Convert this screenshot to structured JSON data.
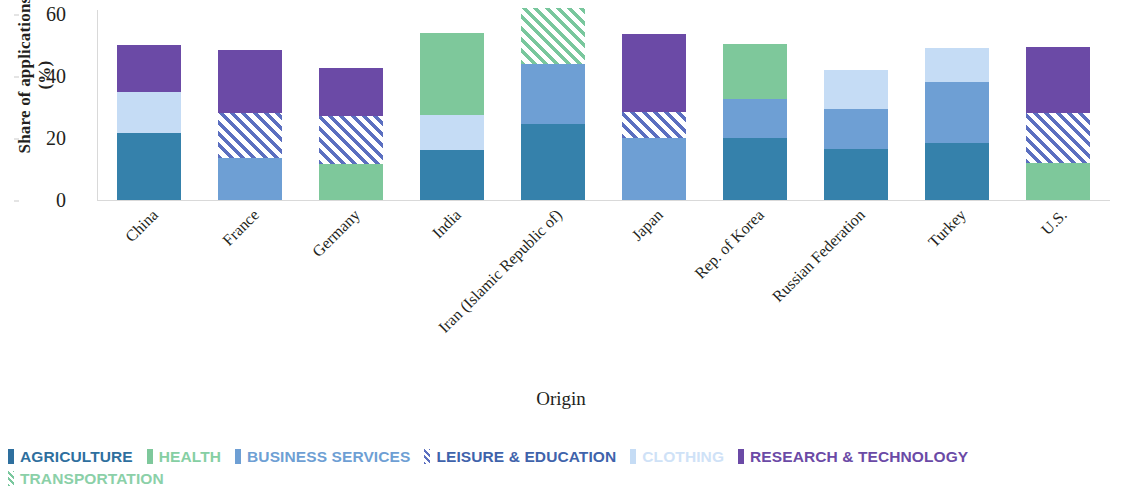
{
  "chart_data": {
    "type": "bar",
    "subtype": "stacked-bar",
    "title": "",
    "xlabel": "Origin",
    "ylabel": "Share of applications (%)",
    "ylim": [
      0,
      62
    ],
    "yticks": [
      0,
      20,
      40,
      60
    ],
    "grid": false,
    "legend_position": "bottom-left",
    "categories": [
      "China",
      "France",
      "Germany",
      "India",
      "Iran (Islamic Republic of)",
      "Japan",
      "Rep. of Korea",
      "Russian Federation",
      "Turkey",
      "U.S."
    ],
    "series": [
      {
        "name": "AGRICULTURE",
        "color": "#3581ab",
        "pattern": "solid",
        "values": [
          21.5,
          0,
          0,
          16.0,
          24.5,
          0,
          20.0,
          16.5,
          18.5,
          0
        ]
      },
      {
        "name": "HEALTH",
        "color": "#7ec89b",
        "pattern": "solid",
        "values": [
          0,
          0,
          11.5,
          26.5,
          0,
          0,
          18.0,
          0,
          0,
          12.0
        ]
      },
      {
        "name": "BUSINESS SERVICES",
        "color": "#6e9fd4",
        "pattern": "solid",
        "values": [
          0,
          13.5,
          0,
          0,
          19.5,
          20.0,
          12.5,
          13.0,
          19.5,
          0
        ]
      },
      {
        "name": "LEISURE & EDUCATION",
        "color": "#5b6fc0",
        "pattern": "diagonal-hatch",
        "values": [
          0,
          14.5,
          15.5,
          0,
          0,
          8.5,
          0,
          0,
          0,
          16.0
        ]
      },
      {
        "name": "CLOTHING",
        "color": "#c5dcf5",
        "pattern": "solid",
        "values": [
          13.5,
          0,
          0,
          11.5,
          0,
          0,
          0,
          12.5,
          11.0,
          0
        ]
      },
      {
        "name": "RESEARCH & TECHNOLOGY",
        "color": "#6b4aa6",
        "pattern": "solid",
        "values": [
          15.0,
          20.5,
          15.5,
          0,
          0,
          25.0,
          0,
          0,
          0,
          21.5
        ]
      },
      {
        "name": "TRANSPORTATION",
        "color": "#79c79d",
        "pattern": "diagonal-hatch",
        "values": [
          0,
          0,
          0,
          0,
          18.0,
          0,
          0,
          0,
          0,
          0
        ]
      }
    ],
    "stack_order": [
      [
        "AGRICULTURE",
        "CLOTHING",
        "RESEARCH & TECHNOLOGY"
      ],
      [
        "BUSINESS SERVICES",
        "LEISURE & EDUCATION",
        "RESEARCH & TECHNOLOGY"
      ],
      [
        "HEALTH",
        "LEISURE & EDUCATION",
        "RESEARCH & TECHNOLOGY"
      ],
      [
        "AGRICULTURE",
        "CLOTHING",
        "HEALTH"
      ],
      [
        "AGRICULTURE",
        "BUSINESS SERVICES",
        "TRANSPORTATION"
      ],
      [
        "BUSINESS SERVICES",
        "LEISURE & EDUCATION",
        "RESEARCH & TECHNOLOGY"
      ],
      [
        "AGRICULTURE",
        "BUSINESS SERVICES",
        "HEALTH"
      ],
      [
        "AGRICULTURE",
        "BUSINESS SERVICES",
        "CLOTHING"
      ],
      [
        "AGRICULTURE",
        "BUSINESS SERVICES",
        "CLOTHING"
      ],
      [
        "HEALTH",
        "LEISURE & EDUCATION",
        "RESEARCH & TECHNOLOGY"
      ]
    ],
    "bars": [
      {
        "category": "China",
        "total": 50.0,
        "segments": [
          {
            "name": "AGRICULTURE",
            "value": 21.5,
            "start": 0,
            "end": 21.5
          },
          {
            "name": "CLOTHING",
            "value": 13.5,
            "start": 21.5,
            "end": 35.0
          },
          {
            "name": "RESEARCH & TECHNOLOGY",
            "value": 15.0,
            "start": 35.0,
            "end": 50.0
          }
        ]
      },
      {
        "category": "France",
        "total": 48.5,
        "segments": [
          {
            "name": "BUSINESS SERVICES",
            "value": 13.5,
            "start": 0,
            "end": 13.5
          },
          {
            "name": "LEISURE & EDUCATION",
            "value": 14.5,
            "start": 13.5,
            "end": 28.0
          },
          {
            "name": "RESEARCH & TECHNOLOGY",
            "value": 20.5,
            "start": 28.0,
            "end": 48.5
          }
        ]
      },
      {
        "category": "Germany",
        "total": 42.5,
        "segments": [
          {
            "name": "HEALTH",
            "value": 11.5,
            "start": 0,
            "end": 11.5
          },
          {
            "name": "LEISURE & EDUCATION",
            "value": 15.5,
            "start": 11.5,
            "end": 27.0
          },
          {
            "name": "RESEARCH & TECHNOLOGY",
            "value": 15.5,
            "start": 27.0,
            "end": 42.5
          }
        ]
      },
      {
        "category": "India",
        "total": 54.0,
        "segments": [
          {
            "name": "AGRICULTURE",
            "value": 16.0,
            "start": 0,
            "end": 16.0
          },
          {
            "name": "CLOTHING",
            "value": 11.5,
            "start": 16.0,
            "end": 27.5
          },
          {
            "name": "HEALTH",
            "value": 26.5,
            "start": 27.5,
            "end": 54.0
          }
        ]
      },
      {
        "category": "Iran (Islamic Republic of)",
        "total": 62.0,
        "segments": [
          {
            "name": "AGRICULTURE",
            "value": 24.5,
            "start": 0,
            "end": 24.5
          },
          {
            "name": "BUSINESS SERVICES",
            "value": 19.5,
            "start": 24.5,
            "end": 44.0
          },
          {
            "name": "TRANSPORTATION",
            "value": 18.0,
            "start": 44.0,
            "end": 62.0
          }
        ]
      },
      {
        "category": "Japan",
        "total": 53.5,
        "segments": [
          {
            "name": "BUSINESS SERVICES",
            "value": 20.0,
            "start": 0,
            "end": 20.0
          },
          {
            "name": "LEISURE & EDUCATION",
            "value": 8.5,
            "start": 20.0,
            "end": 28.5
          },
          {
            "name": "RESEARCH & TECHNOLOGY",
            "value": 25.0,
            "start": 28.5,
            "end": 53.5
          }
        ]
      },
      {
        "category": "Rep. of Korea",
        "total": 50.5,
        "segments": [
          {
            "name": "AGRICULTURE",
            "value": 20.0,
            "start": 0,
            "end": 20.0
          },
          {
            "name": "BUSINESS SERVICES",
            "value": 12.5,
            "start": 20.0,
            "end": 32.5
          },
          {
            "name": "HEALTH",
            "value": 18.0,
            "start": 32.5,
            "end": 50.5
          }
        ]
      },
      {
        "category": "Russian Federation",
        "total": 42.0,
        "segments": [
          {
            "name": "AGRICULTURE",
            "value": 16.5,
            "start": 0,
            "end": 16.5
          },
          {
            "name": "BUSINESS SERVICES",
            "value": 13.0,
            "start": 16.5,
            "end": 29.5
          },
          {
            "name": "CLOTHING",
            "value": 12.5,
            "start": 29.5,
            "end": 42.0
          }
        ]
      },
      {
        "category": "Turkey",
        "total": 49.0,
        "segments": [
          {
            "name": "AGRICULTURE",
            "value": 18.5,
            "start": 0,
            "end": 18.5
          },
          {
            "name": "BUSINESS SERVICES",
            "value": 19.5,
            "start": 18.5,
            "end": 38.0
          },
          {
            "name": "CLOTHING",
            "value": 11.0,
            "start": 38.0,
            "end": 49.0
          }
        ]
      },
      {
        "category": "U.S.",
        "total": 49.5,
        "segments": [
          {
            "name": "HEALTH",
            "value": 12.0,
            "start": 0,
            "end": 12.0
          },
          {
            "name": "LEISURE & EDUCATION",
            "value": 16.0,
            "start": 12.0,
            "end": 28.0
          },
          {
            "name": "RESEARCH & TECHNOLOGY",
            "value": 21.5,
            "start": 28.0,
            "end": 49.5
          }
        ]
      }
    ]
  },
  "axes": {
    "y_title": "Share of applications (%)",
    "y_title_line1": "Share of applications",
    "y_title_line2": "(%)",
    "x_title": "Origin",
    "y_tick_labels": [
      "60",
      "40",
      "20",
      "0"
    ]
  },
  "legend": {
    "items": [
      {
        "label": "AGRICULTURE",
        "color": "#2e6f9e",
        "text_color": "#2e6f9e",
        "pattern": "solid"
      },
      {
        "label": "HEALTH",
        "color": "#7ec89b",
        "text_color": "#86cfa3",
        "pattern": "solid"
      },
      {
        "label": "BUSINESS SERVICES",
        "color": "#6e9fd4",
        "text_color": "#6e9fd4",
        "pattern": "solid"
      },
      {
        "label": "LEISURE & EDUCATION",
        "color": "#5b6fc0",
        "text_color": "#3f63ab",
        "pattern": "diagonal-hatch"
      },
      {
        "label": "CLOTHING",
        "color": "#c5dcf5",
        "text_color": "#cfe2f7",
        "pattern": "solid"
      },
      {
        "label": "RESEARCH & TECHNOLOGY",
        "color": "#6b4aa6",
        "text_color": "#6b4aa6",
        "pattern": "solid"
      },
      {
        "label": "TRANSPORTATION",
        "color": "#79c79d",
        "text_color": "#8bd0a8",
        "pattern": "diagonal-hatch"
      }
    ]
  }
}
